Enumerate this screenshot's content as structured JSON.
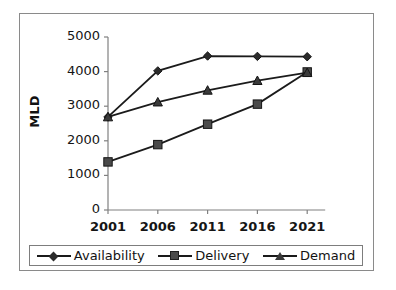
{
  "chart_data": {
    "type": "line",
    "title": "",
    "xlabel": "",
    "ylabel": "MLD",
    "categories": [
      "2001",
      "2006",
      "2011",
      "2016",
      "2021"
    ],
    "x": [
      2001,
      2006,
      2011,
      2016,
      2021
    ],
    "ylim": [
      0,
      5000
    ],
    "xlim": [
      2001,
      2021
    ],
    "yticks": [
      0,
      1000,
      2000,
      3000,
      4000,
      5000
    ],
    "ytick_labels": [
      "0",
      "1000",
      "2000",
      "3000",
      "4000",
      "5000"
    ],
    "xtick_labels": [
      "2001",
      "2006",
      "2011",
      "2016",
      "2021"
    ],
    "grid": false,
    "legend_position": "bottom",
    "series": [
      {
        "name": "Availability",
        "marker": "diamond",
        "color": "#2b2b2b",
        "values": [
          2690,
          4020,
          4450,
          4440,
          4430
        ]
      },
      {
        "name": "Delivery",
        "marker": "square",
        "color": "#4a4a4a",
        "values": [
          1390,
          1890,
          2480,
          3060,
          3990
        ]
      },
      {
        "name": "Demand",
        "marker": "triangle",
        "color": "#3a3a3a",
        "values": [
          2690,
          3120,
          3460,
          3740,
          3970
        ]
      }
    ]
  },
  "axis": {
    "y_title": "MLD"
  },
  "legend": {
    "items": [
      {
        "label": "Availability"
      },
      {
        "label": "Delivery"
      },
      {
        "label": "Demand"
      }
    ]
  }
}
